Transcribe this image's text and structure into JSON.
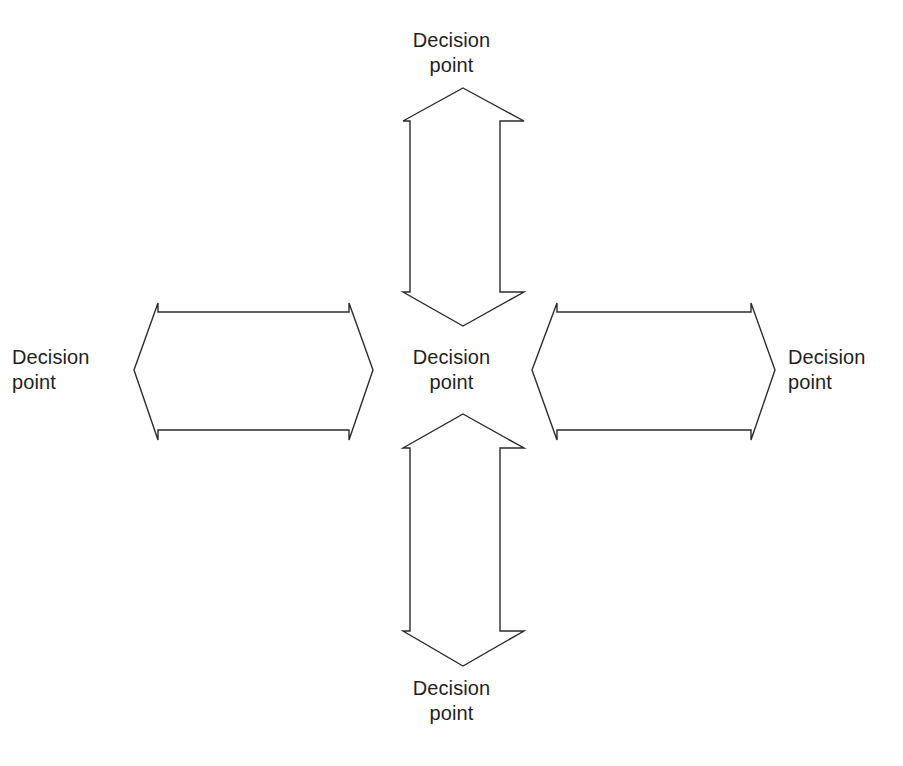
{
  "page": {
    "background_color": "#ffffff",
    "line_color": "#2b2b2b",
    "text_color": "#1f1f1f"
  },
  "labels": {
    "top": "Decision\npoint",
    "bottom": "Decision\npoint",
    "center": "Decision\npoint",
    "left": "Decision\npoint",
    "right": "Decision\npoint"
  },
  "shapes": {
    "vertical_up_arrow": {
      "name": "double-headed-vertical-arrow-upper",
      "orientation": "vertical",
      "heads": "both-ends",
      "tip_top": [
        463,
        88
      ],
      "tip_bottom": [
        463,
        326
      ],
      "shaft_left_x": 410,
      "shaft_right_x": 500,
      "head_left_x": 403,
      "head_right_x": 524
    },
    "vertical_down_arrow": {
      "name": "double-headed-vertical-arrow-lower",
      "orientation": "vertical",
      "heads": "both-ends",
      "tip_top": [
        463,
        414
      ],
      "tip_bottom": [
        463,
        666
      ],
      "shaft_left_x": 410,
      "shaft_right_x": 500,
      "head_left_x": 403,
      "head_right_x": 524
    },
    "horizontal_left_arrow": {
      "name": "double-headed-horizontal-arrow-left",
      "orientation": "horizontal",
      "heads": "both-ends",
      "tip_left": [
        134,
        370
      ],
      "tip_right": [
        373,
        370
      ],
      "shaft_top_y": 312,
      "shaft_bottom_y": 430,
      "head_top_y": 303,
      "head_bottom_y": 440
    },
    "horizontal_right_arrow": {
      "name": "double-headed-horizontal-arrow-right",
      "orientation": "horizontal",
      "heads": "both-ends",
      "tip_left": [
        532,
        370
      ],
      "tip_right": [
        775,
        370
      ],
      "shaft_top_y": 312,
      "shaft_bottom_y": 430,
      "head_top_y": 303,
      "head_bottom_y": 440
    }
  }
}
